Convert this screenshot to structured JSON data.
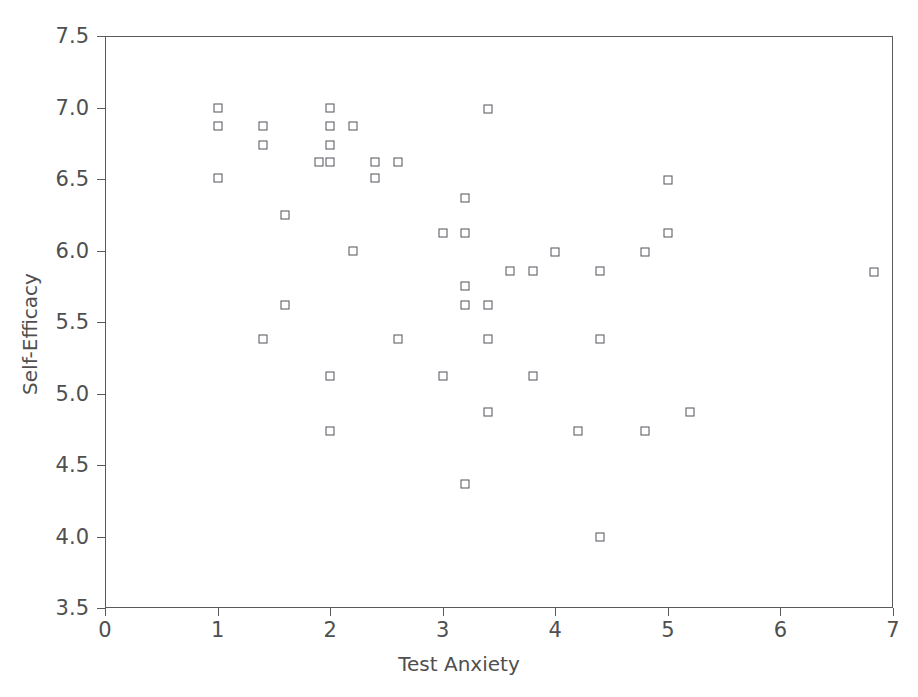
{
  "chart_data": {
    "type": "scatter",
    "title": "",
    "xlabel": "Test Anxiety",
    "ylabel": "Self-Efficacy",
    "xlim": [
      0,
      7
    ],
    "ylim": [
      3.5,
      7.5
    ],
    "xticks": [
      0,
      1,
      2,
      3,
      4,
      5,
      6,
      7
    ],
    "xtick_labels": [
      "0",
      "1",
      "2",
      "3",
      "4",
      "5",
      "6",
      "7"
    ],
    "yticks": [
      3.5,
      4.0,
      4.5,
      5.0,
      5.5,
      6.0,
      6.5,
      7.0,
      7.5
    ],
    "ytick_labels": [
      "3.5",
      "4.0",
      "4.5",
      "5.0",
      "5.5",
      "6.0",
      "6.5",
      "7.0",
      "7.5"
    ],
    "grid": false,
    "legend": null,
    "marker": "open-square",
    "marker_color": "#53535a",
    "marker_fill": "#ffffff",
    "n_points": 50,
    "points": [
      {
        "x": 1.0,
        "y": 7.0
      },
      {
        "x": 1.0,
        "y": 6.87
      },
      {
        "x": 1.0,
        "y": 6.51
      },
      {
        "x": 1.4,
        "y": 6.87
      },
      {
        "x": 1.4,
        "y": 6.74
      },
      {
        "x": 1.4,
        "y": 5.38
      },
      {
        "x": 1.6,
        "y": 6.25
      },
      {
        "x": 1.6,
        "y": 5.62
      },
      {
        "x": 2.0,
        "y": 7.0
      },
      {
        "x": 2.0,
        "y": 6.87
      },
      {
        "x": 2.0,
        "y": 6.74
      },
      {
        "x": 2.0,
        "y": 6.62
      },
      {
        "x": 2.0,
        "y": 5.12
      },
      {
        "x": 2.0,
        "y": 4.74
      },
      {
        "x": 1.9,
        "y": 6.62
      },
      {
        "x": 2.2,
        "y": 6.87
      },
      {
        "x": 2.2,
        "y": 6.0
      },
      {
        "x": 2.4,
        "y": 6.62
      },
      {
        "x": 2.4,
        "y": 6.51
      },
      {
        "x": 2.6,
        "y": 6.62
      },
      {
        "x": 2.6,
        "y": 5.38
      },
      {
        "x": 3.0,
        "y": 6.12
      },
      {
        "x": 3.0,
        "y": 5.12
      },
      {
        "x": 3.2,
        "y": 6.37
      },
      {
        "x": 3.2,
        "y": 6.12
      },
      {
        "x": 3.2,
        "y": 5.75
      },
      {
        "x": 3.2,
        "y": 5.62
      },
      {
        "x": 3.2,
        "y": 4.37
      },
      {
        "x": 3.4,
        "y": 6.99
      },
      {
        "x": 3.4,
        "y": 5.62
      },
      {
        "x": 3.4,
        "y": 5.38
      },
      {
        "x": 3.4,
        "y": 4.87
      },
      {
        "x": 3.6,
        "y": 5.86
      },
      {
        "x": 3.8,
        "y": 5.86
      },
      {
        "x": 3.8,
        "y": 5.12
      },
      {
        "x": 4.0,
        "y": 5.99
      },
      {
        "x": 4.2,
        "y": 4.74
      },
      {
        "x": 4.4,
        "y": 5.86
      },
      {
        "x": 4.4,
        "y": 5.38
      },
      {
        "x": 4.4,
        "y": 4.0
      },
      {
        "x": 4.8,
        "y": 5.99
      },
      {
        "x": 4.8,
        "y": 4.74
      },
      {
        "x": 5.0,
        "y": 6.49
      },
      {
        "x": 5.0,
        "y": 6.12
      },
      {
        "x": 5.2,
        "y": 4.87
      },
      {
        "x": 6.83,
        "y": 5.85
      }
    ]
  }
}
